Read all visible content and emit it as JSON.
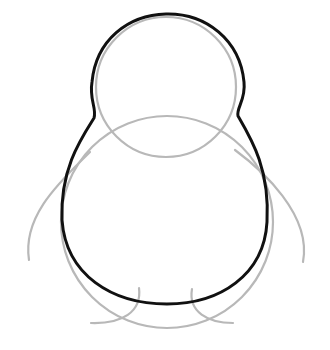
{
  "drawing": {
    "subject": "penguin construction sketch",
    "background_color": "#ffffff",
    "guide_color": "#b8b8b8",
    "outline_color": "#111111",
    "shapes": [
      {
        "name": "head-circle",
        "type": "circle",
        "cx": 166,
        "cy": 87,
        "r": 70
      },
      {
        "name": "body-circle",
        "type": "circle",
        "cx": 167,
        "cy": 222,
        "r": 106
      },
      {
        "name": "left-wing-guide",
        "type": "curve"
      },
      {
        "name": "right-wing-guide",
        "type": "curve"
      },
      {
        "name": "left-foot-guide",
        "type": "curve"
      },
      {
        "name": "right-foot-guide",
        "type": "curve"
      },
      {
        "name": "body-outline",
        "type": "path"
      }
    ]
  }
}
